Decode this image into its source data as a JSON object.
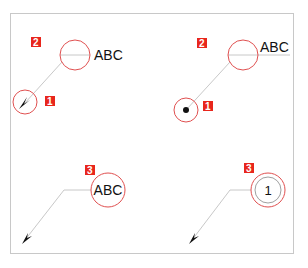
{
  "colors": {
    "badge": "#e8261c",
    "circle": "#e05050",
    "leader": "#c8c8c8",
    "arrow": "#111111",
    "frame": "#c8c8c8"
  },
  "panels": [
    {
      "id": "top-left",
      "leader_label": "ABC",
      "terminator": "arrowhead",
      "badges": [
        {
          "number": "2",
          "target": "label-circle"
        },
        {
          "number": "1",
          "target": "terminator-circle"
        }
      ]
    },
    {
      "id": "top-right",
      "leader_label": "ABC",
      "terminator": "dot",
      "badges": [
        {
          "number": "2",
          "target": "label-circle"
        },
        {
          "number": "1",
          "target": "terminator-circle"
        }
      ]
    },
    {
      "id": "bottom-left",
      "balloon_text": "ABC",
      "terminator": "arrowhead",
      "badges": [
        {
          "number": "3",
          "target": "balloon"
        }
      ]
    },
    {
      "id": "bottom-right",
      "balloon_text": "1",
      "terminator": "arrowhead",
      "balloon_style": "double-circle",
      "badges": [
        {
          "number": "3",
          "target": "balloon"
        }
      ]
    }
  ]
}
